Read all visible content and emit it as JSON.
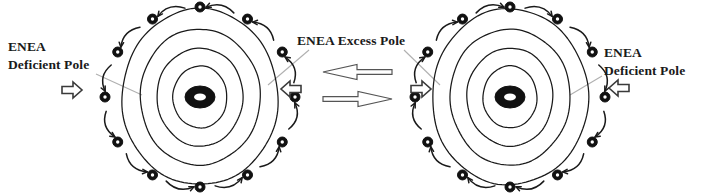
{
  "figure": {
    "kind": "scientific-diagram",
    "background_color": "#ffffff",
    "ink_color": "#1a1a1a",
    "leader_line_color": "#b0b0b0",
    "arrow_outline_color": "#555555"
  },
  "labels": {
    "left_pole": {
      "line1": "ENEA",
      "line2": "Deficient Pole"
    },
    "center_pole": {
      "line1": "ENEA Excess Pole"
    },
    "right_pole": {
      "line1": "ENEA",
      "line2": "Deficient Pole"
    }
  },
  "diagrams": [
    {
      "id": "left-field-diagram",
      "center": {
        "x": 200,
        "y": 97
      },
      "rings": [
        {
          "rx": 78,
          "ry": 88
        },
        {
          "rx": 60,
          "ry": 68
        },
        {
          "rx": 43,
          "ry": 49
        },
        {
          "rx": 27,
          "ry": 31
        }
      ],
      "nucleus": {
        "rx": 15,
        "ry": 11,
        "inner_rx": 6,
        "inner_ry": 3.5
      },
      "orbit": {
        "rx": 95,
        "ry": 90
      },
      "particle_count": 12,
      "particle_radius": 5,
      "rotation": "counterclockwise",
      "deficient_pole_side": "left",
      "excess_pole_side": "right"
    },
    {
      "id": "right-field-diagram",
      "center": {
        "x": 510,
        "y": 97
      },
      "rings": [
        {
          "rx": 78,
          "ry": 88
        },
        {
          "rx": 60,
          "ry": 68
        },
        {
          "rx": 43,
          "ry": 49
        },
        {
          "rx": 27,
          "ry": 31
        }
      ],
      "nucleus": {
        "rx": 15,
        "ry": 11,
        "inner_rx": 6,
        "inner_ry": 3.5
      },
      "orbit": {
        "rx": 95,
        "ry": 90
      },
      "particle_count": 12,
      "particle_radius": 5,
      "rotation": "clockwise",
      "deficient_pole_side": "right",
      "excess_pole_side": "left"
    }
  ],
  "pole_arrows": [
    {
      "id": "left-outer-pole-arrow",
      "x": 62,
      "y": 90,
      "direction": "right"
    },
    {
      "id": "left-inner-pole-arrow",
      "x": 281,
      "y": 89,
      "direction": "left"
    },
    {
      "id": "right-inner-pole-arrow",
      "x": 411,
      "y": 89,
      "direction": "right"
    },
    {
      "id": "right-outer-pole-arrow",
      "x": 609,
      "y": 88,
      "direction": "left"
    }
  ],
  "exchange_arrows": [
    {
      "id": "exchange-arrow-left",
      "direction": "left",
      "y": 72,
      "x1": 323,
      "x2": 392
    },
    {
      "id": "exchange-arrow-right",
      "direction": "right",
      "y": 99,
      "x1": 323,
      "x2": 392
    }
  ],
  "leader_lines": [
    {
      "id": "leader-left-label",
      "x1": 96,
      "y1": 74,
      "x2": 142,
      "y2": 95
    },
    {
      "id": "leader-center-label-left",
      "x1": 309,
      "y1": 50,
      "x2": 268,
      "y2": 85
    },
    {
      "id": "leader-center-label-right",
      "x1": 404,
      "y1": 50,
      "x2": 440,
      "y2": 85
    },
    {
      "id": "leader-right-label",
      "x1": 602,
      "y1": 76,
      "x2": 570,
      "y2": 95
    }
  ]
}
